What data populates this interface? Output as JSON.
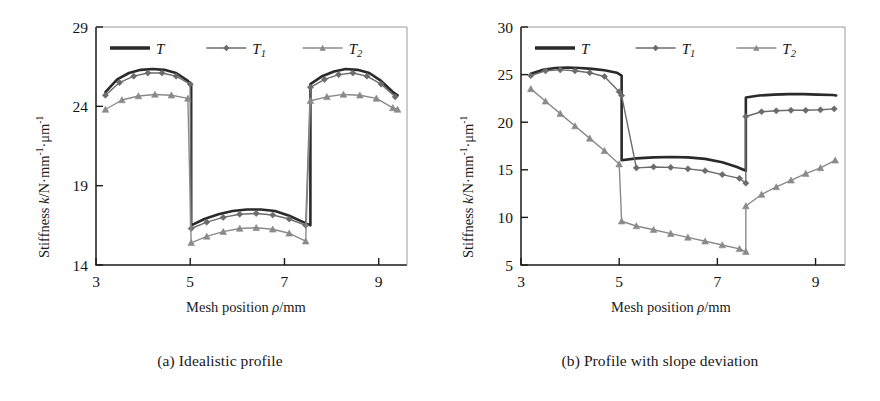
{
  "figure": {
    "background": "#ffffff",
    "ink": "#1a1a1a"
  },
  "panels": [
    {
      "id": "a",
      "caption": "(a) Idealistic profile",
      "axis": {
        "ylabel_prefix": "Stiffness ",
        "ylabel_k": "k",
        "ylabel_unit_1": "/N",
        "ylabel_dot1": "·",
        "ylabel_mm": "mm",
        "ylabel_sup1": "-1",
        "ylabel_dot2": "·",
        "ylabel_um": "μm",
        "ylabel_sup2": "-1",
        "xlabel_prefix": "Mesh position ",
        "xlabel_rho": "ρ",
        "xlabel_unit": "/mm",
        "yticks": [
          14,
          19,
          24,
          29
        ],
        "xticks": [
          3,
          5,
          7,
          9
        ],
        "ylim": [
          14,
          29
        ],
        "xlim": [
          3,
          9.6
        ]
      },
      "legend": {
        "position": "top-center-inside",
        "entries": [
          {
            "label": "T",
            "sub": "",
            "style": "solid-thick",
            "color": "#2a2a2a"
          },
          {
            "label": "T",
            "sub": "1",
            "style": "line-diamond",
            "color": "#6b6b6b"
          },
          {
            "label": "T",
            "sub": "2",
            "style": "line-triangle",
            "color": "#8a8a8a"
          }
        ]
      }
    },
    {
      "id": "b",
      "caption": "(b) Profile with slope deviation",
      "axis": {
        "ylabel_prefix": "Stiffness ",
        "ylabel_k": "k",
        "ylabel_unit_1": "/N",
        "ylabel_dot1": "·",
        "ylabel_mm": "mm",
        "ylabel_sup1": "-1",
        "ylabel_dot2": "·",
        "ylabel_um": "μm",
        "ylabel_sup2": "-1",
        "xlabel_prefix": "Mesh position ",
        "xlabel_rho": "ρ",
        "xlabel_unit": "/mm",
        "yticks": [
          5,
          10,
          15,
          20,
          25,
          30
        ],
        "xticks": [
          3,
          5,
          7,
          9
        ],
        "ylim": [
          5,
          30
        ],
        "xlim": [
          3,
          9.6
        ]
      },
      "legend": {
        "position": "top-center-inside",
        "entries": [
          {
            "label": "T",
            "sub": "",
            "style": "solid-thick",
            "color": "#2a2a2a"
          },
          {
            "label": "T",
            "sub": "1",
            "style": "line-diamond",
            "color": "#6b6b6b"
          },
          {
            "label": "T",
            "sub": "2",
            "style": "line-triangle",
            "color": "#8a8a8a"
          }
        ]
      }
    }
  ],
  "chart_data": [
    {
      "type": "line",
      "title": "(a) Idealistic profile",
      "xlabel": "Mesh position ρ/mm",
      "ylabel": "Stiffness k/N·mm⁻¹·μm⁻¹",
      "xlim": [
        3,
        9.6
      ],
      "ylim": [
        14,
        29
      ],
      "xticks": [
        3,
        5,
        7,
        9
      ],
      "yticks": [
        14,
        19,
        24,
        29
      ],
      "grid": false,
      "legend": [
        "T",
        "T1",
        "T2"
      ],
      "series": [
        {
          "name": "T",
          "marker": "none",
          "color": "#2a2a2a",
          "x": [
            3.2,
            3.45,
            3.7,
            3.95,
            4.2,
            4.45,
            4.7,
            4.95,
            5.02,
            5.02,
            5.3,
            5.6,
            5.9,
            6.2,
            6.5,
            6.8,
            7.1,
            7.4,
            7.55,
            7.55,
            7.8,
            8.05,
            8.3,
            8.55,
            8.8,
            9.05,
            9.3,
            9.4
          ],
          "y": [
            24.9,
            25.7,
            26.1,
            26.3,
            26.35,
            26.3,
            26.1,
            25.6,
            25.4,
            16.5,
            16.9,
            17.2,
            17.4,
            17.5,
            17.5,
            17.4,
            17.1,
            16.7,
            16.5,
            25.4,
            25.9,
            26.2,
            26.35,
            26.3,
            26.1,
            25.6,
            24.9,
            24.7
          ]
        },
        {
          "name": "T1",
          "marker": "diamond",
          "color": "#6b6b6b",
          "x": [
            3.2,
            3.5,
            3.8,
            4.1,
            4.4,
            4.7,
            5.0,
            5.02,
            5.35,
            5.7,
            6.05,
            6.4,
            6.75,
            7.1,
            7.45,
            7.55,
            7.85,
            8.15,
            8.45,
            8.75,
            9.05,
            9.35
          ],
          "y": [
            24.7,
            25.5,
            25.9,
            26.1,
            26.1,
            25.9,
            25.4,
            16.3,
            16.7,
            17.0,
            17.2,
            17.25,
            17.15,
            16.9,
            16.5,
            25.2,
            25.7,
            26.0,
            26.1,
            25.9,
            25.4,
            24.6
          ]
        },
        {
          "name": "T2",
          "marker": "triangle",
          "color": "#8a8a8a",
          "x": [
            3.2,
            3.55,
            3.9,
            4.25,
            4.6,
            4.95,
            5.02,
            5.35,
            5.7,
            6.05,
            6.4,
            6.75,
            7.1,
            7.45,
            7.55,
            7.9,
            8.25,
            8.6,
            8.95,
            9.3,
            9.4
          ],
          "y": [
            23.8,
            24.4,
            24.65,
            24.75,
            24.7,
            24.5,
            15.4,
            15.8,
            16.1,
            16.3,
            16.35,
            16.25,
            16.0,
            15.5,
            24.35,
            24.6,
            24.75,
            24.7,
            24.5,
            23.9,
            23.8
          ]
        }
      ]
    },
    {
      "type": "line",
      "title": "(b) Profile with slope deviation",
      "xlabel": "Mesh position ρ/mm",
      "ylabel": "Stiffness k/N·mm⁻¹·μm⁻¹",
      "xlim": [
        3,
        9.6
      ],
      "ylim": [
        5,
        30
      ],
      "xticks": [
        3,
        5,
        7,
        9
      ],
      "yticks": [
        5,
        10,
        15,
        20,
        25,
        30
      ],
      "grid": false,
      "legend": [
        "T",
        "T1",
        "T2"
      ],
      "series": [
        {
          "name": "T",
          "marker": "none",
          "color": "#2a2a2a",
          "x": [
            3.2,
            3.45,
            3.7,
            3.95,
            4.2,
            4.45,
            4.7,
            4.95,
            5.05,
            5.05,
            5.35,
            5.7,
            6.05,
            6.4,
            6.75,
            7.1,
            7.4,
            7.58,
            7.58,
            7.85,
            8.15,
            8.45,
            8.75,
            9.05,
            9.35,
            9.42
          ],
          "y": [
            25.1,
            25.5,
            25.7,
            25.75,
            25.7,
            25.6,
            25.45,
            25.2,
            24.9,
            16.0,
            16.2,
            16.3,
            16.35,
            16.3,
            16.15,
            15.8,
            15.3,
            14.9,
            22.6,
            22.8,
            22.9,
            22.95,
            22.95,
            22.9,
            22.85,
            22.8
          ]
        },
        {
          "name": "T1",
          "marker": "diamond",
          "color": "#6b6b6b",
          "x": [
            3.2,
            3.5,
            3.8,
            4.1,
            4.4,
            4.7,
            5.0,
            5.05,
            5.35,
            5.7,
            6.05,
            6.4,
            6.75,
            7.1,
            7.45,
            7.58,
            7.58,
            7.9,
            8.2,
            8.5,
            8.8,
            9.1,
            9.38
          ],
          "y": [
            24.9,
            25.4,
            25.5,
            25.4,
            25.2,
            24.8,
            23.2,
            22.8,
            15.2,
            15.3,
            15.25,
            15.1,
            14.9,
            14.5,
            14.1,
            13.6,
            20.6,
            21.1,
            21.2,
            21.25,
            21.25,
            21.3,
            21.4
          ]
        },
        {
          "name": "T2",
          "marker": "triangle",
          "color": "#8a8a8a",
          "x": [
            3.2,
            3.5,
            3.8,
            4.1,
            4.4,
            4.7,
            5.0,
            5.05,
            5.35,
            5.7,
            6.05,
            6.4,
            6.75,
            7.1,
            7.45,
            7.58,
            7.58,
            7.9,
            8.2,
            8.5,
            8.8,
            9.1,
            9.4
          ],
          "y": [
            23.5,
            22.2,
            20.9,
            19.6,
            18.3,
            17.0,
            15.6,
            9.6,
            9.1,
            8.7,
            8.3,
            7.9,
            7.5,
            7.1,
            6.7,
            6.4,
            11.2,
            12.4,
            13.2,
            13.9,
            14.6,
            15.2,
            16.0
          ]
        }
      ]
    }
  ]
}
